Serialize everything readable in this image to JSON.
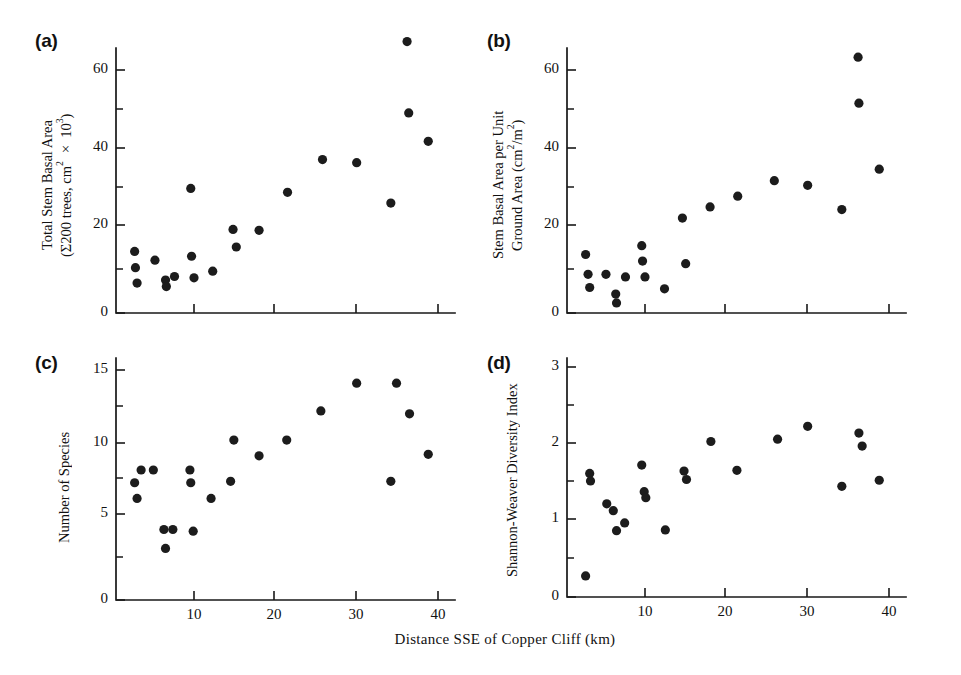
{
  "figure": {
    "xlabel": "Distance SSE of Copper Cliff (km)",
    "background": "#ffffff",
    "marker_color": "#1c1c1c",
    "axis_color": "#181818"
  },
  "panels": {
    "a": {
      "letter": "(a)",
      "ylabel_line1": "Total Stem Basal Area",
      "ylabel_line2": "(Σ200 trees, cm² × 10³)",
      "yticks": [
        "0",
        "20",
        "40",
        "60"
      ],
      "xticks": [
        "10",
        "20",
        "30",
        "40"
      ]
    },
    "b": {
      "letter": "(b)",
      "ylabel_line1": "Stem Basal Area per Unit",
      "ylabel_line2": "Ground Area (cm²/m²)",
      "yticks": [
        "0",
        "20",
        "40",
        "60"
      ],
      "xticks": [
        "10",
        "20",
        "30",
        "40"
      ]
    },
    "c": {
      "letter": "(c)",
      "ylabel_line1": "Number of Species",
      "ylabel_line2": "",
      "yticks": [
        "0",
        "5",
        "10",
        "15"
      ],
      "xticks": [
        "10",
        "20",
        "30",
        "40"
      ]
    },
    "d": {
      "letter": "(d)",
      "ylabel_line1": "Shannon-Weaver Diversity Index",
      "ylabel_line2": "",
      "yticks": [
        "0",
        "1",
        "2",
        "3"
      ],
      "xticks": [
        "10",
        "20",
        "30",
        "40"
      ]
    }
  },
  "chart_data": [
    {
      "type": "scatter",
      "panel": "a",
      "title": "(a)",
      "xlabel": "Distance SSE of Copper Cliff (km)",
      "ylabel": "Total Stem Basal Area (Σ200 trees, cm² × 10³)",
      "xlim": [
        0,
        44
      ],
      "ylim": [
        0,
        70
      ],
      "xticks": [
        10,
        20,
        30,
        40
      ],
      "yticks": [
        0,
        20,
        40,
        60
      ],
      "yminorticks": [
        10,
        30,
        50
      ],
      "grid": false,
      "legend": null,
      "points": [
        {
          "x": 2.7,
          "y": 14.0
        },
        {
          "x": 2.8,
          "y": 10.3
        },
        {
          "x": 3.0,
          "y": 6.8
        },
        {
          "x": 5.2,
          "y": 12.0
        },
        {
          "x": 6.5,
          "y": 7.5
        },
        {
          "x": 6.6,
          "y": 6.0
        },
        {
          "x": 7.6,
          "y": 8.3
        },
        {
          "x": 9.6,
          "y": 29.5
        },
        {
          "x": 9.7,
          "y": 12.9
        },
        {
          "x": 10.0,
          "y": 8.0
        },
        {
          "x": 12.3,
          "y": 9.5
        },
        {
          "x": 14.8,
          "y": 19.0
        },
        {
          "x": 15.2,
          "y": 15.0
        },
        {
          "x": 18.0,
          "y": 18.8
        },
        {
          "x": 21.5,
          "y": 28.5
        },
        {
          "x": 25.8,
          "y": 37.0
        },
        {
          "x": 30.0,
          "y": 36.2
        },
        {
          "x": 34.2,
          "y": 25.7
        },
        {
          "x": 36.2,
          "y": 67.3
        },
        {
          "x": 36.4,
          "y": 49.0
        },
        {
          "x": 38.8,
          "y": 41.7
        }
      ]
    },
    {
      "type": "scatter",
      "panel": "b",
      "title": "(b)",
      "xlabel": "Distance SSE of Copper Cliff (km)",
      "ylabel": "Stem Basal Area per Unit Ground Area (cm²/m²)",
      "xlim": [
        0,
        44
      ],
      "ylim": [
        0,
        70
      ],
      "xticks": [
        10,
        20,
        30,
        40
      ],
      "yticks": [
        0,
        20,
        40,
        60
      ],
      "yminorticks": [
        10,
        30,
        50
      ],
      "grid": false,
      "legend": null,
      "points": [
        {
          "x": 2.7,
          "y": 13.3
        },
        {
          "x": 3.0,
          "y": 8.8
        },
        {
          "x": 3.2,
          "y": 5.8
        },
        {
          "x": 5.2,
          "y": 8.8
        },
        {
          "x": 6.4,
          "y": 4.3
        },
        {
          "x": 6.5,
          "y": 2.3
        },
        {
          "x": 7.6,
          "y": 8.2
        },
        {
          "x": 9.6,
          "y": 15.3
        },
        {
          "x": 9.7,
          "y": 11.8
        },
        {
          "x": 10.0,
          "y": 8.2
        },
        {
          "x": 12.4,
          "y": 5.5
        },
        {
          "x": 14.6,
          "y": 21.8
        },
        {
          "x": 15.0,
          "y": 11.2
        },
        {
          "x": 18.0,
          "y": 24.7
        },
        {
          "x": 21.4,
          "y": 27.5
        },
        {
          "x": 25.9,
          "y": 31.5
        },
        {
          "x": 30.0,
          "y": 30.3
        },
        {
          "x": 34.2,
          "y": 24.0
        },
        {
          "x": 36.2,
          "y": 63.3
        },
        {
          "x": 36.3,
          "y": 51.5
        },
        {
          "x": 38.8,
          "y": 34.5
        }
      ]
    },
    {
      "type": "scatter",
      "panel": "c",
      "title": "(c)",
      "xlabel": "Distance SSE of Copper Cliff (km)",
      "ylabel": "Number of Species",
      "xlim": [
        0,
        44
      ],
      "ylim": [
        0,
        16
      ],
      "xticks": [
        10,
        20,
        30,
        40
      ],
      "yticks": [
        0,
        5,
        10,
        15
      ],
      "yminorticks": [
        2.5,
        7.5,
        12.5
      ],
      "grid": false,
      "legend": null,
      "points": [
        {
          "x": 2.7,
          "y": 7.2
        },
        {
          "x": 3.0,
          "y": 6.1
        },
        {
          "x": 3.5,
          "y": 8.1
        },
        {
          "x": 5.0,
          "y": 8.1
        },
        {
          "x": 6.3,
          "y": 4.1
        },
        {
          "x": 6.5,
          "y": 3.0
        },
        {
          "x": 7.4,
          "y": 4.1
        },
        {
          "x": 9.5,
          "y": 8.1
        },
        {
          "x": 9.6,
          "y": 7.2
        },
        {
          "x": 9.9,
          "y": 4.0
        },
        {
          "x": 12.1,
          "y": 6.1
        },
        {
          "x": 14.5,
          "y": 7.3
        },
        {
          "x": 14.9,
          "y": 10.2
        },
        {
          "x": 18.0,
          "y": 9.1
        },
        {
          "x": 21.4,
          "y": 10.2
        },
        {
          "x": 25.6,
          "y": 12.2
        },
        {
          "x": 30.0,
          "y": 14.1
        },
        {
          "x": 34.2,
          "y": 7.3
        },
        {
          "x": 34.9,
          "y": 14.1
        },
        {
          "x": 36.5,
          "y": 12.0
        },
        {
          "x": 38.8,
          "y": 9.2
        }
      ]
    },
    {
      "type": "scatter",
      "panel": "d",
      "title": "(d)",
      "xlabel": "Distance SSE of Copper Cliff (km)",
      "ylabel": "Shannon-Weaver Diversity Index",
      "xlim": [
        0,
        44
      ],
      "ylim": [
        0,
        3.3
      ],
      "xticks": [
        10,
        20,
        30,
        40
      ],
      "yticks": [
        0,
        1,
        2,
        3
      ],
      "yminorticks": [
        0.5,
        1.5,
        2.5
      ],
      "grid": false,
      "legend": null,
      "points": [
        {
          "x": 2.7,
          "y": 0.27
        },
        {
          "x": 3.2,
          "y": 1.6
        },
        {
          "x": 3.3,
          "y": 1.5
        },
        {
          "x": 5.3,
          "y": 1.2
        },
        {
          "x": 6.1,
          "y": 1.11
        },
        {
          "x": 6.5,
          "y": 0.85
        },
        {
          "x": 7.5,
          "y": 0.95
        },
        {
          "x": 9.6,
          "y": 1.71
        },
        {
          "x": 9.9,
          "y": 1.36
        },
        {
          "x": 10.1,
          "y": 1.28
        },
        {
          "x": 12.5,
          "y": 0.86
        },
        {
          "x": 14.8,
          "y": 1.63
        },
        {
          "x": 15.1,
          "y": 1.52
        },
        {
          "x": 18.1,
          "y": 2.02
        },
        {
          "x": 21.3,
          "y": 1.64
        },
        {
          "x": 26.3,
          "y": 2.05
        },
        {
          "x": 30.0,
          "y": 2.22
        },
        {
          "x": 34.2,
          "y": 1.43
        },
        {
          "x": 36.3,
          "y": 2.13
        },
        {
          "x": 36.7,
          "y": 1.96
        },
        {
          "x": 38.8,
          "y": 1.51
        }
      ]
    }
  ]
}
